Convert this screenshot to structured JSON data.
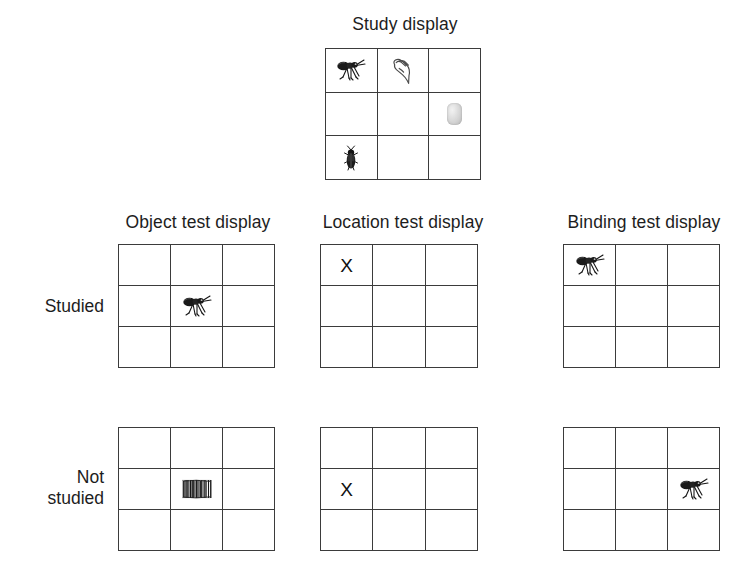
{
  "figure": {
    "study": {
      "title": "Study display",
      "grid": [
        [
          "ant-icon",
          "hand-icon",
          ""
        ],
        [
          "",
          "",
          "blob-icon"
        ],
        [
          "beetle-icon",
          "",
          ""
        ]
      ]
    },
    "row_labels": [
      {
        "key": "studied",
        "text": "Studied"
      },
      {
        "key": "not-studied",
        "text": "Not\nstudied"
      }
    ],
    "columns": [
      {
        "key": "object",
        "title": "Object test display"
      },
      {
        "key": "location",
        "title": "Location test display"
      },
      {
        "key": "binding",
        "title": "Binding test display"
      }
    ],
    "test_grids": [
      {
        "row": "studied",
        "column": "object",
        "grid": [
          [
            "",
            "",
            ""
          ],
          [
            "",
            "ant-icon",
            ""
          ],
          [
            "",
            "",
            ""
          ]
        ]
      },
      {
        "row": "studied",
        "column": "location",
        "grid": [
          [
            "x-mark",
            "",
            ""
          ],
          [
            "",
            "",
            ""
          ],
          [
            "",
            "",
            ""
          ]
        ]
      },
      {
        "row": "studied",
        "column": "binding",
        "grid": [
          [
            "ant-icon",
            "",
            ""
          ],
          [
            "",
            "",
            ""
          ],
          [
            "",
            "",
            ""
          ]
        ]
      },
      {
        "row": "not-studied",
        "column": "object",
        "grid": [
          [
            "",
            "",
            ""
          ],
          [
            "",
            "accordion-icon",
            ""
          ],
          [
            "",
            "",
            ""
          ]
        ]
      },
      {
        "row": "not-studied",
        "column": "location",
        "grid": [
          [
            "",
            "",
            ""
          ],
          [
            "x-mark",
            "",
            ""
          ],
          [
            "",
            "",
            ""
          ]
        ]
      },
      {
        "row": "not-studied",
        "column": "binding",
        "grid": [
          [
            "",
            "",
            ""
          ],
          [
            "",
            "",
            "ant-icon"
          ],
          [
            "",
            "",
            ""
          ]
        ]
      }
    ],
    "marks": {
      "x_label": "X"
    },
    "colors": {
      "grid_line": "#3b3b3b",
      "text": "#1d1d1d",
      "background": "#ffffff",
      "blob_gray": "#cfcfcf"
    }
  }
}
